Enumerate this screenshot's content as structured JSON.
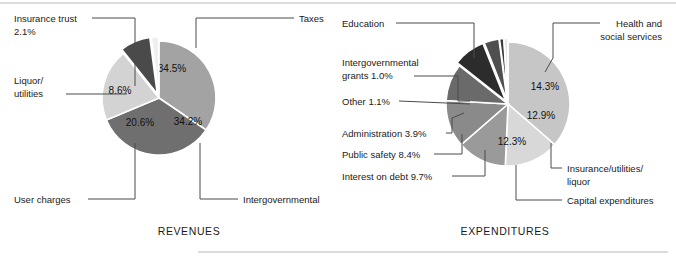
{
  "figure": {
    "rules": [
      {
        "name": "top-rule",
        "x1": 0,
        "y1": 3,
        "x2": 676,
        "y2": 3
      },
      {
        "name": "bottom-rule",
        "x1": 198,
        "y1": 252,
        "x2": 668,
        "y2": 252
      }
    ]
  },
  "charts": [
    {
      "id": "revenues",
      "caption": "REVENUES",
      "caption_x": 189,
      "caption_y": 235,
      "center_x": 159,
      "center_y": 98,
      "radius": 57,
      "start_angle": -90,
      "chart_data": {
        "type": "pie",
        "title": "REVENUES",
        "labels": [
          "Taxes",
          "Intergovernmental",
          "User charges",
          "Liquor/ utilities",
          "Insurance trust"
        ],
        "values": [
          34.5,
          34.2,
          20.6,
          8.6,
          2.1
        ],
        "value_labels": [
          "34.5%",
          "34.2%",
          "20.6%",
          "8.6%",
          "2.1%"
        ],
        "colors": [
          "#a3a3a3",
          "#6f6f6f",
          "#d3d3d3",
          "#4a4a4a",
          "#efefef"
        ],
        "explode": [
          0,
          0,
          0,
          0.07,
          0.07
        ],
        "show_value_in_slice": [
          true,
          true,
          true,
          true,
          false
        ]
      },
      "slices": [
        {
          "name": "slice-taxes",
          "label": "Taxes",
          "value": 34.5,
          "value_label": "34.5%",
          "color": "#a3a3a3",
          "explode": 0,
          "value_text_color": "#111111",
          "value_x": 172,
          "value_y": 72
        },
        {
          "name": "slice-intergovernmental",
          "label": "Intergovernmental",
          "value": 34.2,
          "value_label": "34.2%",
          "color": "#6f6f6f",
          "explode": 0,
          "value_text_color": "#151515",
          "value_x": 188,
          "value_y": 125
        },
        {
          "name": "slice-user-charges",
          "label": "User charges",
          "value": 20.6,
          "value_label": "20.6%",
          "color": "#d3d3d3",
          "explode": 0,
          "value_text_color": "#111111",
          "value_x": 140,
          "value_y": 126
        },
        {
          "name": "slice-liquor-utilities",
          "label": "Liquor/ utilities",
          "value": 8.6,
          "value_label": "8.6%",
          "color": "#4a4a4a",
          "explode": 0.075,
          "value_text_color": "#f2f2f2",
          "value_x": 120,
          "value_y": 94
        },
        {
          "name": "slice-insurance-trust",
          "label": "Insurance trust",
          "value": 2.1,
          "value_label": "2.1%",
          "color": "#efefef",
          "explode": 0.075,
          "value_text_color": "#111111",
          "value_x": 0,
          "value_y": 0
        }
      ],
      "callouts": [
        {
          "name": "callout-insurance-trust",
          "lines": [
            "Insurance trust",
            "2.1%"
          ],
          "align": "start",
          "text_x": 14,
          "text_y": 22,
          "line_height": 13,
          "path": "M 92,18 L 135,18 L 135,86"
        },
        {
          "name": "callout-liquor-utilities",
          "lines": [
            "Liquor/",
            "utilities"
          ],
          "align": "start",
          "text_x": 14,
          "text_y": 84,
          "line_height": 13,
          "path": "M 66,94 L 127,94"
        },
        {
          "name": "callout-user-charges",
          "lines": [
            "User charges"
          ],
          "align": "start",
          "text_x": 14,
          "text_y": 203,
          "line_height": 13,
          "path": "M 88,199 L 135,199 L 135,143"
        },
        {
          "name": "callout-taxes",
          "lines": [
            "Taxes"
          ],
          "align": "start",
          "text_x": 299,
          "text_y": 22,
          "line_height": 13,
          "path": "M 294,18 L 196,18 L 196,48"
        },
        {
          "name": "callout-intergovernmental",
          "lines": [
            "Intergovernmental"
          ],
          "align": "start",
          "text_x": 243,
          "text_y": 203,
          "line_height": 13,
          "path": "M 238,199 L 200,199 L 200,143"
        }
      ]
    },
    {
      "id": "expenditures",
      "caption": "EXPENDITURES",
      "caption_x": 505,
      "caption_y": 235,
      "center_x": 508,
      "center_y": 104,
      "radius": 62,
      "start_angle": -90,
      "chart_data": {
        "type": "pie",
        "title": "EXPENDITURES",
        "labels": [
          "Education",
          "Health and social services",
          "Insurance/utilities/ liquor",
          "Capital expenditures",
          "Interest on debt",
          "Public safety",
          "Administration",
          "Other",
          "Intergovernmental grants"
        ],
        "values": [
          36.4,
          14.3,
          12.9,
          12.3,
          9.7,
          8.4,
          3.9,
          1.1,
          1.0
        ],
        "value_labels": [
          "36.4%",
          "14.3%",
          "12.9%",
          "12.3%",
          "9.7%",
          "8.4%",
          "3.9%",
          "1.1%",
          "1.0%"
        ],
        "colors": [
          "#c6c6c6",
          "#d8d8d8",
          "#9a9a9a",
          "#8a8a8a",
          "#6a6a6a",
          "#2c2c2c",
          "#4f4f4f",
          "#3a3a3a",
          "#e6e6e6"
        ],
        "explode": [
          0,
          0,
          0,
          0,
          0,
          0.06,
          0.06,
          0.06,
          0.06
        ],
        "show_value_in_slice": [
          true,
          true,
          true,
          true,
          false,
          false,
          false,
          false,
          false
        ]
      },
      "slices": [
        {
          "name": "slice-education",
          "label": "Education",
          "value": 36.4,
          "value_label": "36.4%",
          "color": "#c6c6c6",
          "explode": 0,
          "value_text_color": "#111111",
          "value_x": 494,
          "value_y": 77
        },
        {
          "name": "slice-health-social-services",
          "label": "Health and social services",
          "value": 14.3,
          "value_label": "14.3%",
          "color": "#d8d8d8",
          "explode": 0,
          "value_text_color": "#111111",
          "value_x": 545,
          "value_y": 90
        },
        {
          "name": "slice-insurance-utilities-liquor",
          "label": "Insurance/utilities/ liquor",
          "value": 12.9,
          "value_label": "12.9%",
          "color": "#9a9a9a",
          "explode": 0,
          "value_text_color": "#111111",
          "value_x": 541,
          "value_y": 119
        },
        {
          "name": "slice-capital-expenditures",
          "label": "Capital expenditures",
          "value": 12.3,
          "value_label": "12.3%",
          "color": "#8a8a8a",
          "explode": 0,
          "value_text_color": "#111111",
          "value_x": 512,
          "value_y": 145
        },
        {
          "name": "slice-interest-on-debt",
          "label": "Interest on debt",
          "value": 9.7,
          "value_label": "9.7%",
          "color": "#6a6a6a",
          "explode": 0,
          "value_text_color": "#f0f0f0",
          "value_x": 0,
          "value_y": 0
        },
        {
          "name": "slice-public-safety",
          "label": "Public safety",
          "value": 8.4,
          "value_label": "8.4%",
          "color": "#2c2c2c",
          "explode": 0.06,
          "value_text_color": "#f0f0f0",
          "value_x": 0,
          "value_y": 0
        },
        {
          "name": "slice-administration",
          "label": "Administration",
          "value": 3.9,
          "value_label": "3.9%",
          "color": "#4f4f4f",
          "explode": 0.06,
          "value_text_color": "#f0f0f0",
          "value_x": 0,
          "value_y": 0
        },
        {
          "name": "slice-other",
          "label": "Other",
          "value": 1.1,
          "value_label": "1.1%",
          "color": "#3a3a3a",
          "explode": 0.06,
          "value_text_color": "#f0f0f0",
          "value_x": 0,
          "value_y": 0
        },
        {
          "name": "slice-intergovernmental-grants",
          "label": "Intergovernmental grants",
          "value": 1.0,
          "value_label": "1.0%",
          "color": "#e6e6e6",
          "explode": 0.06,
          "value_text_color": "#111111",
          "value_x": 0,
          "value_y": 0
        }
      ],
      "callouts": [
        {
          "name": "callout-education",
          "lines": [
            "Education"
          ],
          "align": "start",
          "text_x": 342,
          "text_y": 27,
          "line_height": 13,
          "path": "M 396,23 L 474,23 L 474,58"
        },
        {
          "name": "callout-intergovernmental-grants",
          "lines": [
            "Intergovernmental",
            "grants 1.0%"
          ],
          "align": "start",
          "text_x": 342,
          "text_y": 66,
          "line_height": 13,
          "path": "M 414,76 L 458,76 L 458,101 L 470,101"
        },
        {
          "name": "callout-other",
          "lines": [
            "Other 1.1%"
          ],
          "align": "start",
          "text_x": 342,
          "text_y": 105,
          "line_height": 13,
          "path": "M 399,101 L 470,104"
        },
        {
          "name": "callout-administration",
          "lines": [
            "Administration 3.9%"
          ],
          "align": "start",
          "text_x": 342,
          "text_y": 137,
          "line_height": 13,
          "path": "M 446,133 L 452,133 L 452,118 L 464,113"
        },
        {
          "name": "callout-public-safety",
          "lines": [
            "Public safety 8.4%"
          ],
          "align": "start",
          "text_x": 342,
          "text_y": 158,
          "line_height": 13,
          "path": "M 434,154 L 462,154 L 462,134"
        },
        {
          "name": "callout-interest-on-debt",
          "lines": [
            "Interest on debt 9.7%"
          ],
          "align": "start",
          "text_x": 342,
          "text_y": 180,
          "line_height": 13,
          "path": "M 452,176 L 485,176 L 485,150"
        },
        {
          "name": "callout-health-social-services",
          "lines": [
            "Health and",
            "social services"
          ],
          "align": "end",
          "text_x": 662,
          "text_y": 27,
          "line_height": 13,
          "path": "M 600,23 L 553,23 L 553,58 L 545,72"
        },
        {
          "name": "callout-insurance-utilities-liquor",
          "lines": [
            "Insurance/utilities/",
            "liquor"
          ],
          "align": "start",
          "text_x": 567,
          "text_y": 172,
          "line_height": 13,
          "path": "M 562,168 L 551,168 L 551,143"
        },
        {
          "name": "callout-capital-expenditures",
          "lines": [
            "Capital expenditures"
          ],
          "align": "start",
          "text_x": 567,
          "text_y": 204,
          "line_height": 13,
          "path": "M 562,200 L 516,200 L 516,165"
        }
      ]
    }
  ]
}
